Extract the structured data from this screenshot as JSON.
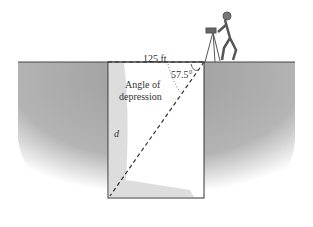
{
  "figure": {
    "type": "angle of depression diagram",
    "labels": {
      "width": "125 ft",
      "angle_value": "57.5°",
      "angle_name_line1": "Angle of",
      "angle_name_line2": "depression",
      "depth_variable": "d"
    },
    "colors": {
      "ground": "#a8a8a8",
      "pit_interior": "#ffffff",
      "pit_shadow": "#c8c8c8",
      "lines": "#333333"
    }
  }
}
